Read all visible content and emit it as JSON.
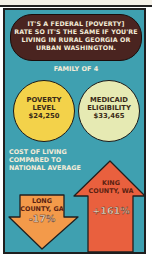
{
  "bubble": {
    "lines": [
      "IT'S A FEDERAL [POVERTY]",
      "RATE SO IT'S THE SAME IF YOU'RE",
      "LIVING IN RURAL GEORGIA OR",
      "URBAN WASHINGTON."
    ]
  },
  "family_label": "FAMILY OF 4",
  "circles": [
    {
      "lines": [
        "POVERTY",
        "LEVEL"
      ],
      "value": "$24,250",
      "color": "#f3d24a"
    },
    {
      "lines": [
        "MEDICAID",
        "ELIGIBILITY"
      ],
      "value": "$33,465",
      "color": "#e6eab3"
    }
  ],
  "cost_of_living": {
    "lines": [
      "COST OF LIVING",
      "COMPARED TO",
      "NATIONAL AVERAGE"
    ]
  },
  "arrows": [
    {
      "lines": [
        "LONG",
        "COUNTY, GA"
      ],
      "value": "-17%",
      "direction": "down",
      "color": "#f39a4a"
    },
    {
      "lines": [
        "KING",
        "COUNTY, WA"
      ],
      "value": "+161%",
      "direction": "up",
      "color": "#e9603e"
    }
  ],
  "colors": {
    "panel": "#3fa0b0",
    "bubble": "#4a2420"
  }
}
